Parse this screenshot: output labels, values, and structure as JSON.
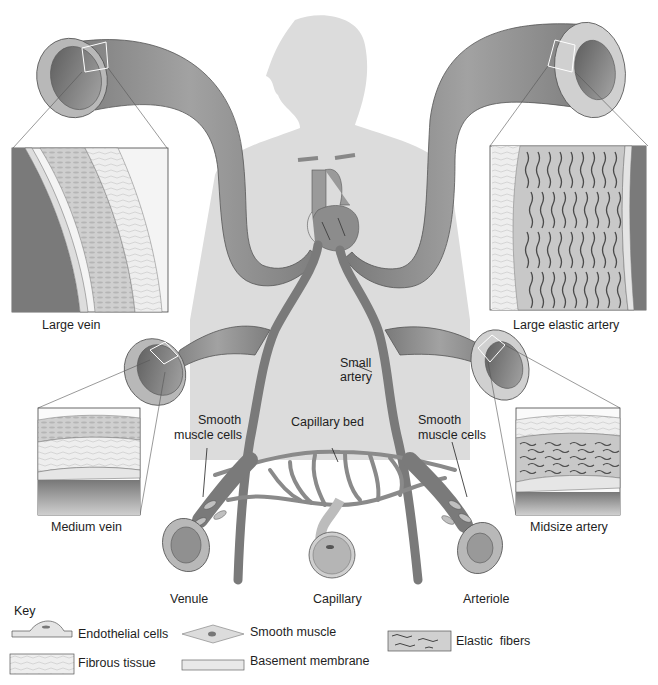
{
  "diagram": {
    "vessel_labels": {
      "large_vein": "Large vein",
      "large_elastic_artery": "Large elastic artery",
      "medium_vein": "Medium vein",
      "midsize_artery": "Midsize artery",
      "venule": "Venule",
      "capillary": "Capillary",
      "arteriole": "Arteriole"
    },
    "callouts": {
      "small_artery_line1": "Small",
      "small_artery_line2": "artery",
      "capillary_bed": "Capillary bed",
      "smooth_muscle_left_line1": "Smooth",
      "smooth_muscle_left_line2": "muscle cells",
      "smooth_muscle_right_line1": "Smooth",
      "smooth_muscle_right_line2": "muscle cells"
    },
    "key": {
      "title": "Key",
      "items": [
        {
          "label": "Endothelial cells",
          "icon": "endothelial-cell-icon"
        },
        {
          "label": "Smooth muscle",
          "icon": "smooth-muscle-icon"
        },
        {
          "label": "Elastic  fibers",
          "icon": "elastic-fibers-icon"
        },
        {
          "label": "Fibrous tissue",
          "icon": "fibrous-tissue-icon"
        },
        {
          "label": "Basement membrane",
          "icon": "basement-membrane-icon"
        }
      ]
    },
    "colors": {
      "vessel": "#8a8a8a",
      "vessel_dark": "#6e6e6e",
      "vessel_light": "#b5b5b5",
      "silhouette": "#d6d6d6",
      "tissue_light": "#e8e8e8",
      "fiber_dark": "#4a4a4a"
    }
  }
}
